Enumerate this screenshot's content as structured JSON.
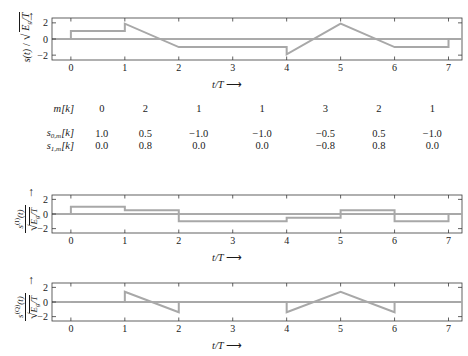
{
  "figure": {
    "trace_color": "#a8a8a8",
    "axis_color": "#3a3a3a",
    "xlabel": "t/T",
    "xlabel_arrow": "⟶",
    "up_arrow": "↑"
  },
  "axes": {
    "x_ticks": [
      0,
      1,
      2,
      3,
      4,
      5,
      6,
      7
    ],
    "x_tick_labels": [
      "0",
      "1",
      "2",
      "3",
      "4",
      "5",
      "6",
      "7"
    ],
    "y_ticks": [
      2,
      0,
      -2
    ],
    "y_tick_labels": [
      "2",
      "0",
      "−2"
    ],
    "xlim": [
      -0.35,
      7.25
    ],
    "ylim": [
      -2.6,
      2.6
    ]
  },
  "panel_top": {
    "name": "composite-signal",
    "ylabel_numerator": "s(t)",
    "ylabel_slash": "/",
    "ylabel_radicand": "E",
    "ylabel_radicand_sub": "g",
    "ylabel_radicand_den": "/T"
  },
  "panel_mid": {
    "name": "inphase-signal",
    "ylabel_num_base": "s",
    "ylabel_num_sup": "(I)",
    "ylabel_num_arg": "(t)",
    "ylabel_den_radicand": "E",
    "ylabel_den_sub": "g",
    "ylabel_den_tail": "/T"
  },
  "panel_bot": {
    "name": "quadrature-signal",
    "ylabel_num_base": "s",
    "ylabel_num_sup": "(Q)",
    "ylabel_num_arg": "(t)",
    "ylabel_den_radicand": "E",
    "ylabel_den_sub": "g",
    "ylabel_den_tail": "/T"
  },
  "table": {
    "row_labels": [
      "m[k]",
      "s0,m[k]",
      "s1,m[k]"
    ],
    "row_label_parts": [
      {
        "base": "m",
        "sub": "",
        "tail": "[k]"
      },
      {
        "base": "s",
        "sub": "0,m",
        "tail": "[k]"
      },
      {
        "base": "s",
        "sub": "1,m",
        "tail": "[k]"
      }
    ],
    "symbols": [
      "0",
      "2",
      "1",
      "1",
      "3",
      "2",
      "1"
    ],
    "s0": [
      "1.0",
      "0.5",
      "−1.0",
      "−1.0",
      "−0.5",
      "0.5",
      "−1.0"
    ],
    "s1": [
      "0.0",
      "0.8",
      "0.0",
      "0.0",
      "−0.8",
      "0.8",
      "0.0"
    ]
  },
  "chart_data": {
    "type": "line",
    "title": "",
    "xlabel": "t/T",
    "ylabel": "amplitude (normalized)",
    "xlim": [
      -0.35,
      7.25
    ],
    "ylim": [
      -2.6,
      2.6
    ],
    "grid": false,
    "legend": "none",
    "symbol_interval": 1,
    "num_symbols": 7,
    "amplitudes_inphase": [
      1.0,
      0.5,
      -1.0,
      -1.0,
      -0.5,
      0.5,
      -1.0
    ],
    "amplitudes_quadrature": [
      0.0,
      0.8,
      0.0,
      0.0,
      -0.8,
      0.8,
      0.0
    ],
    "quadrature_peak_scale": 1.75,
    "series": [
      {
        "name": "s(t)/sqrt(Eg/T)",
        "panel": "top",
        "description": "sum of rectangular in-phase pulses and sawtooth quadrature pulses",
        "points": [
          [
            0.0,
            0.0
          ],
          [
            0.0,
            1.0
          ],
          [
            1.0,
            1.0
          ],
          [
            1.0,
            1.9
          ],
          [
            2.0,
            -1.0
          ],
          [
            2.0,
            -1.0
          ],
          [
            4.0,
            -1.0
          ],
          [
            4.0,
            -1.9
          ],
          [
            5.0,
            1.9
          ],
          [
            5.0,
            1.9
          ],
          [
            6.0,
            -1.0
          ],
          [
            6.0,
            -1.0
          ],
          [
            7.0,
            -1.0
          ],
          [
            7.0,
            0.0
          ],
          [
            7.25,
            0.0
          ]
        ]
      },
      {
        "name": "s_I(t)/sqrt(Eg/T)",
        "panel": "middle",
        "description": "rectangular staircase of in-phase symbol amplitudes",
        "points": [
          [
            0.0,
            0.0
          ],
          [
            0.0,
            1.0
          ],
          [
            1.0,
            1.0
          ],
          [
            1.0,
            0.5
          ],
          [
            2.0,
            0.5
          ],
          [
            2.0,
            -1.0
          ],
          [
            3.0,
            -1.0
          ],
          [
            3.0,
            -1.0
          ],
          [
            4.0,
            -1.0
          ],
          [
            4.0,
            -0.5
          ],
          [
            5.0,
            -0.5
          ],
          [
            5.0,
            0.5
          ],
          [
            6.0,
            0.5
          ],
          [
            6.0,
            -1.0
          ],
          [
            7.0,
            -1.0
          ],
          [
            7.0,
            0.0
          ],
          [
            7.25,
            0.0
          ]
        ]
      },
      {
        "name": "s_Q(t)/sqrt(Eg/T)",
        "panel": "bottom",
        "description": "sawtooth ramps scaled by quadrature symbol amplitudes",
        "points": [
          [
            0.0,
            0.0
          ],
          [
            1.0,
            0.0
          ],
          [
            1.0,
            1.4
          ],
          [
            2.0,
            -1.4
          ],
          [
            2.0,
            0.0
          ],
          [
            4.0,
            0.0
          ],
          [
            4.0,
            -1.4
          ],
          [
            5.0,
            1.4
          ],
          [
            5.0,
            1.4
          ],
          [
            6.0,
            -1.4
          ],
          [
            6.0,
            0.0
          ],
          [
            7.25,
            0.0
          ]
        ]
      }
    ]
  }
}
